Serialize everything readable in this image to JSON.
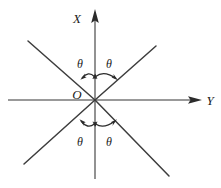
{
  "figure": {
    "title": "",
    "background_color": "#ffffff",
    "line_color": "#3a3a3a",
    "axis_color": "#6a6a6a",
    "text_color": "#1a1a1a",
    "width": 221,
    "height": 188
  },
  "axes": {
    "vertical": {
      "label": "X",
      "icon": "arrow-up-icon",
      "x": 95,
      "top_y": 10,
      "bottom_y": 179,
      "label_x": 82,
      "label_y": 19
    },
    "horizontal": {
      "label": "Y",
      "icon": "arrow-right-icon",
      "y": 100,
      "left_x": 8,
      "right_x": 201,
      "label_x": 206,
      "label_y": 105
    },
    "origin": {
      "label": "O",
      "x": 95,
      "y": 100,
      "label_x": 73,
      "label_y": 99
    }
  },
  "diagonals": [
    {
      "name": "diagonal-up-right",
      "x1": 95,
      "y1": 100,
      "x2": 156,
      "y2": 46
    },
    {
      "name": "diagonal-up-left",
      "x1": 95,
      "y1": 100,
      "x2": 28,
      "y2": 41
    },
    {
      "name": "diagonal-down-left",
      "x1": 95,
      "y1": 100,
      "x2": 24,
      "y2": 164
    },
    {
      "name": "diagonal-down-right",
      "x1": 95,
      "y1": 100,
      "x2": 169,
      "y2": 176
    }
  ],
  "angles": [
    {
      "name": "theta-upper-left",
      "label": "θ",
      "label_x": 76,
      "label_y": 67,
      "arc": "M 81 77 Q 88 70 94 76"
    },
    {
      "name": "theta-upper-right",
      "label": "θ",
      "label_x": 104,
      "label_y": 67,
      "arc": "M 96 76 Q 104 70 117 78"
    },
    {
      "name": "theta-lower-left",
      "label": "θ",
      "label_x": 76,
      "label_y": 145,
      "arc": "M 80 122 Q 87 130 94 125"
    },
    {
      "name": "theta-lower-right",
      "label": "θ",
      "label_x": 104,
      "label_y": 145,
      "arc": "M 96 125 Q 104 130 115 122"
    }
  ],
  "labels": {
    "x_axis": "X",
    "y_axis": "Y",
    "origin": "O",
    "theta": "θ"
  }
}
